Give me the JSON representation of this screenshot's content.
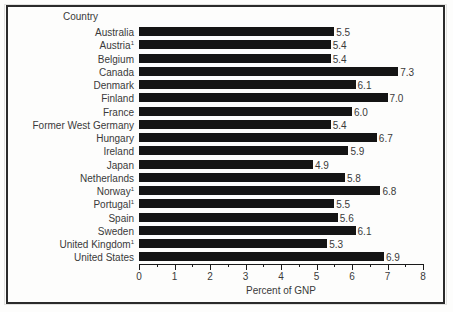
{
  "chart_data": {
    "type": "bar",
    "orientation": "horizontal",
    "title": "",
    "xlabel": "Percent of GNP",
    "ylabel": "Country",
    "xlim": [
      0,
      8
    ],
    "xticks": [
      0,
      1,
      2,
      3,
      4,
      5,
      6,
      7,
      8
    ],
    "xtick_labels": [
      "0",
      "1",
      "2",
      "3",
      "4",
      "5",
      "6",
      "7",
      "8"
    ],
    "minor_ticks": true,
    "grid": false,
    "legend": false,
    "bar_color": "#141414",
    "categories": [
      "Australia",
      "Austria",
      "Belgium",
      "Canada",
      "Denmark",
      "Finland",
      "France",
      "Former West Germany",
      "Hungary",
      "Ireland",
      "Japan",
      "Netherlands",
      "Norway",
      "Portugal",
      "Spain",
      "Sweden",
      "United Kingdom",
      "United States"
    ],
    "footnote_markers": [
      "",
      "1",
      "",
      "",
      "",
      "",
      "",
      "",
      "",
      "",
      "",
      "",
      "1",
      "1",
      "",
      "",
      "1",
      ""
    ],
    "values": [
      5.5,
      5.4,
      5.4,
      7.3,
      6.1,
      7.0,
      6.0,
      5.4,
      6.7,
      5.9,
      4.9,
      5.8,
      6.8,
      5.5,
      5.6,
      6.1,
      5.3,
      6.9
    ],
    "value_labels": [
      "5.5",
      "5.4",
      "5.4",
      "7.3",
      "6.1",
      "7.0",
      "6.0",
      "5.4",
      "6.7",
      "5.9",
      "4.9",
      "5.8",
      "6.8",
      "5.5",
      "5.6",
      "6.1",
      "5.3",
      "6.9"
    ]
  }
}
